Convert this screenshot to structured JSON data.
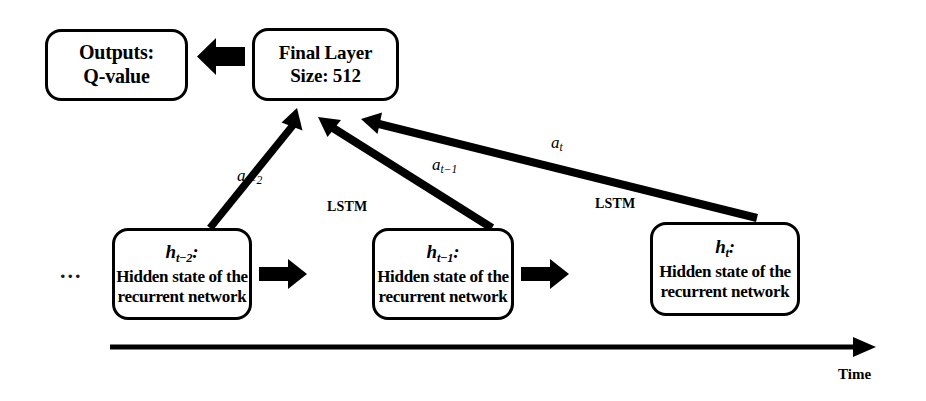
{
  "diagram": {
    "background_color": "#ffffff",
    "stroke_color": "#000000"
  },
  "nodes": {
    "outputs": {
      "line1": "Outputs:",
      "line2": "Q-value"
    },
    "final_layer": {
      "line1": "Final Layer",
      "line2": "Size: 512"
    },
    "hidden_states": [
      {
        "symbol": "h",
        "subscript": "t−2",
        "colon": ":",
        "line1": "Hidden state of the",
        "line2": "recurrent network"
      },
      {
        "symbol": "h",
        "subscript": "t−1",
        "colon": ":",
        "line1": "Hidden state of the",
        "line2": "recurrent network"
      },
      {
        "symbol": "h",
        "subscript": "t",
        "colon": ":",
        "line1": "Hidden state of the",
        "line2": "recurrent network"
      }
    ]
  },
  "edge_labels": {
    "action_t_minus_2": {
      "symbol": "a",
      "subscript": "t−2"
    },
    "action_t_minus_1": {
      "symbol": "a",
      "subscript": "t−1"
    },
    "action_t": {
      "symbol": "a",
      "subscript": "t"
    },
    "lstm_1": "LSTM",
    "lstm_2": "LSTM"
  },
  "axis": {
    "time_label": "Time"
  },
  "continuation": {
    "ellipsis": "..."
  }
}
